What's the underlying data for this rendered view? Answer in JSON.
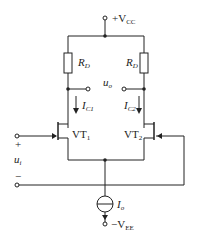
{
  "labels": {
    "vcc": "+V",
    "vcc_sub": "CC",
    "rd_left": "R",
    "rd_left_sub": "D",
    "rd_right": "R",
    "rd_right_sub": "D",
    "uo": "u",
    "uo_sub": "o",
    "ic1": "I",
    "ic1_sub": "C1",
    "ic2": "I",
    "ic2_sub": "C2",
    "vt1": "VT",
    "vt1_sub": "1",
    "vt2": "VT",
    "vt2_sub": "2",
    "ui": "u",
    "ui_sub": "i",
    "plus": "+",
    "minus": "−",
    "io": "I",
    "io_sub": "o",
    "vee": "−V",
    "vee_sub": "EE"
  }
}
